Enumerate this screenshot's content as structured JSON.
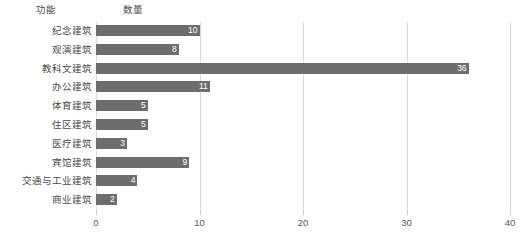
{
  "header": {
    "category_label": "功能",
    "value_label": "数量"
  },
  "chart_data": {
    "type": "bar",
    "orientation": "horizontal",
    "title": "",
    "subtitle": "",
    "xlabel": "数量",
    "ylabel": "功能",
    "xlim": [
      0,
      40
    ],
    "xticks": [
      0,
      10,
      20,
      30,
      40
    ],
    "xtick_labels": [
      "0",
      "10",
      "20",
      "30",
      "40"
    ],
    "grid": true,
    "grid_axis": "x",
    "legend": false,
    "legend_position": "none",
    "bar_color": "#6d6d6d",
    "data_label_color": "#ffffff",
    "categories": [
      "纪念建筑",
      "观演建筑",
      "教科文建筑",
      "办公建筑",
      "体育建筑",
      "住区建筑",
      "医疗建筑",
      "宾馆建筑",
      "交通与工业建筑",
      "商业建筑"
    ],
    "values": [
      10,
      8,
      36,
      11,
      5,
      5,
      3,
      9,
      4,
      2
    ],
    "data_labels": [
      "10",
      "8",
      "36",
      "11",
      "5",
      "5",
      "3",
      "9",
      "4",
      "2"
    ]
  },
  "colors": {
    "background": "#ffffff",
    "bar": "#6d6d6d",
    "gridline": "#d9d9d9",
    "text": "#4a4a4a",
    "tick_text": "#595959"
  }
}
